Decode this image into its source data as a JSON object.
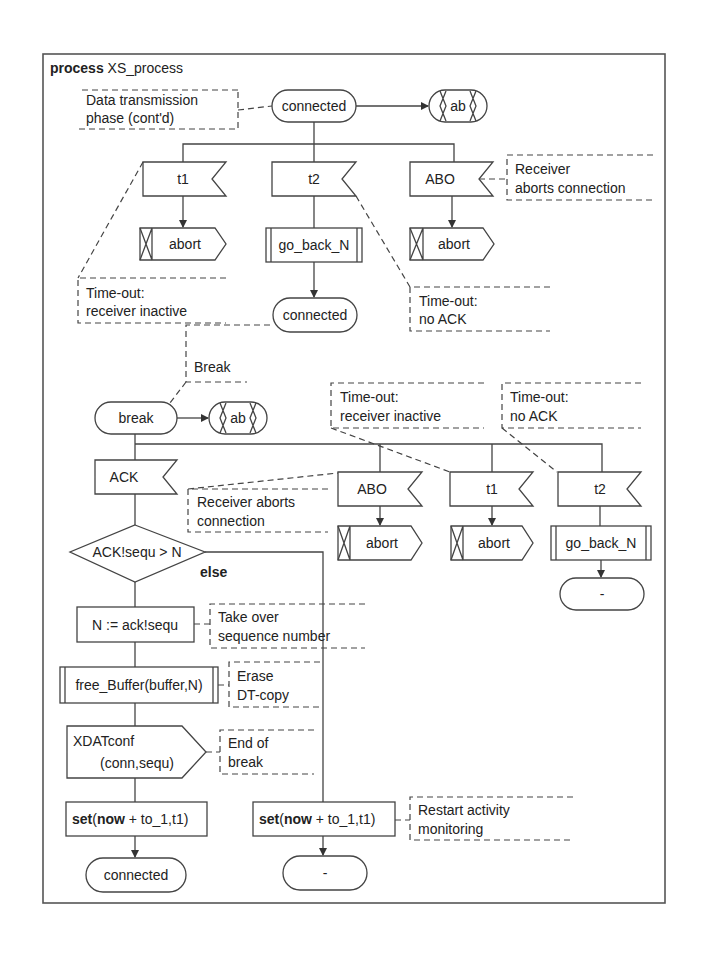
{
  "diagram": {
    "type": "SDL process diagram",
    "title_keyword": "process",
    "title_name": "XS_process",
    "top_section": {
      "comment_data_transmission": [
        "Data transmission",
        "phase (cont'd)"
      ],
      "state_connected": "connected",
      "save_ab": "ab",
      "inputs": [
        "t1",
        "t2",
        "ABO"
      ],
      "comment_receiver_aborts": [
        "Receiver",
        "aborts connection"
      ],
      "output_abort_1": "abort",
      "procedure_go_back": "go_back_N",
      "output_abort_2": "abort",
      "comment_timeout_inactive": [
        "Time-out:",
        "receiver inactive"
      ],
      "next_state_connected": "connected",
      "comment_timeout_noack": [
        "Time-out:",
        "no ACK"
      ]
    },
    "bottom_section": {
      "comment_break": "Break",
      "state_break": "break",
      "save_ab": "ab",
      "comment_timeout_inactive": [
        "Time-out:",
        "receiver inactive"
      ],
      "comment_timeout_noack": [
        "Time-out:",
        "no ACK"
      ],
      "input_ack": "ACK",
      "comment_receiver_aborts": [
        "Receiver aborts",
        "connection"
      ],
      "input_abo": "ABO",
      "input_t1": "t1",
      "input_t2": "t2",
      "output_abort_abo": "abort",
      "output_abort_t1": "abort",
      "procedure_go_back": "go_back_N",
      "next_state_dash_right": "-",
      "decision": "ACK!sequ > N",
      "else_label": "else",
      "task_assign": "N := ack!sequ",
      "comment_take_over": [
        "Take over",
        "sequence number"
      ],
      "procedure_free_buffer": "free_Buffer(buffer,N)",
      "comment_erase": [
        "Erase",
        "DT-copy"
      ],
      "output_xdatconf": [
        "XDATconf",
        "(conn,sequ)"
      ],
      "comment_end_break": [
        "End of",
        "break"
      ],
      "set_kw": "set",
      "now_kw": "now",
      "set_rest_open": "(",
      "set_rest_tail": " + to_1,t1)",
      "comment_restart": [
        "Restart activity",
        "monitoring"
      ],
      "next_state_connected": "connected",
      "next_state_dash": "-"
    }
  }
}
